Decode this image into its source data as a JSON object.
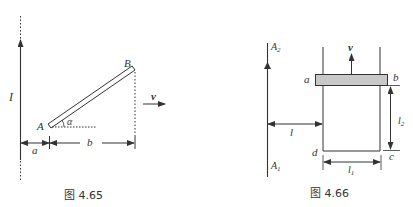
{
  "figure_left": {
    "caption": "图 4.65",
    "labels": {
      "current": "I",
      "end_a": "A",
      "end_b": "B",
      "angle": "α",
      "dist_a": "a",
      "dist_b": "b",
      "velocity": "v"
    }
  },
  "figure_right": {
    "caption": "图 4.66",
    "labels": {
      "wire_top": "A",
      "wire_top_sub": "2",
      "wire_bottom": "A",
      "wire_bottom_sub": "1",
      "velocity": "v",
      "corner_a": "a",
      "corner_b": "b",
      "corner_c": "c",
      "corner_d": "d",
      "dist_l": "l",
      "len_l1": "l",
      "len_l1_sub": "1",
      "len_l2": "l",
      "len_l2_sub": "2"
    },
    "bar_color": "#c8c8c8"
  },
  "colors": {
    "line": "#333333"
  }
}
